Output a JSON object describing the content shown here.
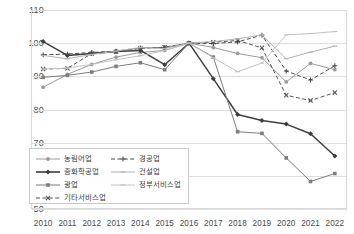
{
  "chart_data": {
    "type": "line",
    "title": "",
    "xlabel": "",
    "ylabel": "",
    "ylim": [
      50,
      110
    ],
    "ytick_values": [
      110,
      100,
      90,
      80,
      70,
      60,
      50
    ],
    "grid": true,
    "legend_position": "inside-bottom-left",
    "base_year_note": "2016=100",
    "x": [
      "2010",
      "2011",
      "2012",
      "2013",
      "2014",
      "2015",
      "2016",
      "2017",
      "2018",
      "2019",
      "2020",
      "2021",
      "2022"
    ],
    "series": [
      {
        "name": "농림어업",
        "color": "#9a9a9a",
        "dash": "solid",
        "marker": "circle",
        "values": [
          86.7,
          90.6,
          93.6,
          95.8,
          97.2,
          97.8,
          100.0,
          98.7,
          96.9,
          95.6,
          88.3,
          93.9,
          92.0
        ]
      },
      {
        "name": "중화학공업",
        "color": "#3d3d3d",
        "dash": "solid",
        "marker": "diamond",
        "values": [
          100.5,
          96.3,
          96.9,
          97.5,
          97.8,
          93.5,
          100.0,
          89.3,
          78.5,
          76.7,
          75.6,
          72.7,
          66.0
        ]
      },
      {
        "name": "광업",
        "color": "#7d7d7d",
        "dash": "solid",
        "marker": "square",
        "values": [
          89.7,
          90.3,
          91.3,
          93.0,
          94.1,
          92.0,
          100.0,
          95.8,
          73.3,
          72.8,
          65.4,
          58.3,
          60.7
        ]
      },
      {
        "name": "기타서비스업",
        "color": "#545454",
        "dash": "dashed",
        "marker": "x",
        "values": [
          92.2,
          92.4,
          96.9,
          97.4,
          98.4,
          98.8,
          100.0,
          100.3,
          100.8,
          98.6,
          84.3,
          82.7,
          85.1
        ]
      },
      {
        "name": "경공업",
        "color": "#4a4a4a",
        "dash": "dashed",
        "marker": "plus",
        "values": [
          96.5,
          96.7,
          97.2,
          97.6,
          98.6,
          98.7,
          100.0,
          99.9,
          100.4,
          102.4,
          91.6,
          88.9,
          93.2
        ]
      },
      {
        "name": "건설업",
        "color": "#b2b2b2",
        "dash": "solid",
        "marker": "dash",
        "values": [
          96.3,
          95.3,
          96.6,
          97.6,
          98.7,
          98.4,
          100.0,
          100.5,
          101.3,
          102.5,
          95.3,
          97.3,
          99.1
        ]
      },
      {
        "name": "정부서비스업",
        "color": "#c2c2c2",
        "dash": "solid",
        "marker": "dash",
        "values": [
          92.2,
          92.5,
          93.6,
          95.0,
          96.2,
          97.8,
          100.0,
          95.6,
          91.4,
          94.0,
          102.5,
          102.9,
          103.5
        ]
      }
    ]
  },
  "legend": {
    "items": [
      {
        "label": "농림어업"
      },
      {
        "label": "경공업"
      },
      {
        "label": "중화학공업"
      },
      {
        "label": "건설업"
      },
      {
        "label": "광업"
      },
      {
        "label": "정부서비스업"
      },
      {
        "label": "기타서비스업"
      }
    ]
  }
}
